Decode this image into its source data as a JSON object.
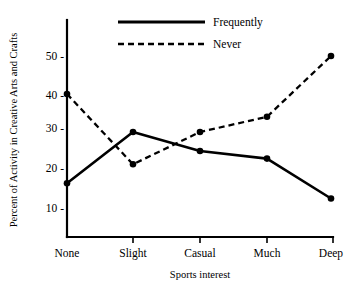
{
  "chart_data": {
    "type": "line",
    "title": "",
    "xlabel": "Sports interest",
    "ylabel": "Percent of Activity in Creative Arts and Crafts",
    "categories": [
      "None",
      "Slight",
      "Casual",
      "Much",
      "Deep"
    ],
    "series": [
      {
        "name": "Frequently",
        "style": "solid",
        "values": [
          16.5,
          30,
          25,
          23,
          12.5
        ]
      },
      {
        "name": "Never",
        "style": "dashed",
        "values": [
          40,
          21.5,
          30,
          34,
          50
        ]
      }
    ],
    "yticks": [
      10,
      20,
      30,
      40,
      50
    ],
    "ytick_labels": [
      "10 -",
      "20 -",
      "30 -",
      "40 -",
      "50 -"
    ],
    "ylim": [
      0,
      58
    ],
    "grid": false,
    "legend_position": "top-center",
    "line_color": "#000000",
    "background_color": "#ffffff"
  },
  "legend": {
    "entries": [
      {
        "label": "Frequently",
        "style": "solid"
      },
      {
        "label": "Never",
        "style": "dashed"
      }
    ]
  },
  "axes": {
    "x_title": "Sports interest",
    "y_title": "Percent of Activity in Creative Arts and Crafts",
    "x_categories": [
      "None",
      "Slight",
      "Casual",
      "Much",
      "Deep"
    ],
    "y_labels": [
      "50 -",
      "40 -",
      "30 -",
      "20 -",
      "10 -"
    ]
  }
}
